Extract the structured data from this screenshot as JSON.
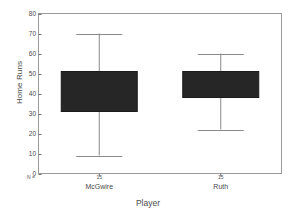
{
  "chart_data": {
    "type": "box",
    "title": "",
    "xlabel": "Player",
    "ylabel": "Home Runs",
    "ylim": [
      0,
      80
    ],
    "ytick_labels": [
      "80",
      "70",
      "60",
      "50",
      "40",
      "30",
      "20",
      "10",
      "0"
    ],
    "ytick_values": [
      80,
      70,
      60,
      50,
      40,
      30,
      20,
      10,
      0
    ],
    "grid": false,
    "legend": "none",
    "n_label": "N =",
    "categories": [
      "McGwire",
      "Ruth"
    ],
    "boxes": [
      {
        "category": "McGwire",
        "n": "15",
        "whisker_low": 9,
        "q1": 31,
        "median": 40,
        "q3": 51,
        "whisker_high": 70
      },
      {
        "category": "Ruth",
        "n": "15",
        "whisker_low": 22,
        "q1": 38,
        "median": 44,
        "q3": 51,
        "whisker_high": 60
      }
    ]
  },
  "colors": {
    "box_fill": "#262626",
    "box_edge": "#1a1a1a",
    "whisker": "#8a8a8a",
    "axis": "#6e6e6e",
    "frame": "#9a9a9a",
    "text": "#4a4a4a",
    "background": "#ffffff"
  }
}
